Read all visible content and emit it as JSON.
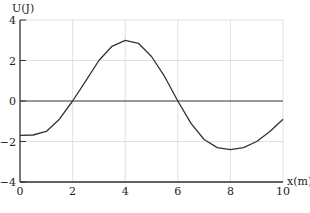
{
  "chart_data": {
    "type": "line",
    "title": "",
    "xlabel": "x(m)",
    "ylabel": "U(J)",
    "xlim": [
      0,
      10
    ],
    "ylim": [
      -4,
      4
    ],
    "x_ticks": [
      "0",
      "2",
      "4",
      "6",
      "8",
      "10"
    ],
    "y_ticks": [
      "4",
      "2",
      "0",
      "-2",
      "-4"
    ],
    "grid": true,
    "legend": null,
    "series": [
      {
        "name": "U(x)",
        "x": [
          0,
          0.5,
          1,
          1.5,
          2,
          2.5,
          3,
          3.5,
          4,
          4.5,
          5,
          5.5,
          6,
          6.5,
          7,
          7.5,
          8,
          8.5,
          9,
          9.5,
          10
        ],
        "y": [
          -1.7,
          -1.68,
          -1.5,
          -0.9,
          0.0,
          1.0,
          2.0,
          2.7,
          3.0,
          2.85,
          2.2,
          1.2,
          0.0,
          -1.1,
          -1.9,
          -2.3,
          -2.4,
          -2.3,
          -2.0,
          -1.5,
          -0.9
        ]
      }
    ]
  },
  "axes": {
    "x_label": "x(m)",
    "y_label": "U(J)",
    "x_tick_labels": [
      "0",
      "2",
      "4",
      "6",
      "8",
      "10"
    ],
    "y_tick_labels": [
      "4",
      "2",
      "0",
      "-2",
      "-4"
    ]
  }
}
